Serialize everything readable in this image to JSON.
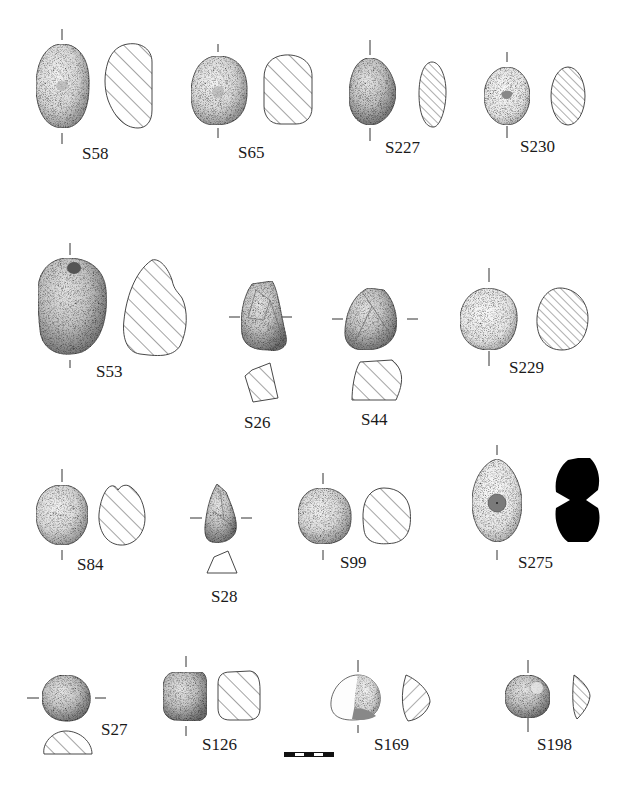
{
  "plate": {
    "type": "archaeological artifact illustration plate",
    "background": "#ffffff",
    "line_color": "#222222",
    "section_fill_black": "#000000"
  },
  "artifacts": [
    {
      "id": "S58",
      "label": "S58",
      "row": 1,
      "section": "hatched"
    },
    {
      "id": "S65",
      "label": "S65",
      "row": 1,
      "section": "hatched"
    },
    {
      "id": "S227",
      "label": "S227",
      "row": 1,
      "section": "hatched"
    },
    {
      "id": "S230",
      "label": "S230",
      "row": 1,
      "section": "hatched"
    },
    {
      "id": "S53",
      "label": "S53",
      "row": 2,
      "section": "hatched"
    },
    {
      "id": "S26",
      "label": "S26",
      "row": 2,
      "section": "hatched-below"
    },
    {
      "id": "S44",
      "label": "S44",
      "row": 2,
      "section": "hatched-below"
    },
    {
      "id": "S229",
      "label": "S229",
      "row": 2,
      "section": "hatched"
    },
    {
      "id": "S84",
      "label": "S84",
      "row": 3,
      "section": "hatched"
    },
    {
      "id": "S28",
      "label": "S28",
      "row": 3,
      "section": "outline-below"
    },
    {
      "id": "S99",
      "label": "S99",
      "row": 3,
      "section": "hatched"
    },
    {
      "id": "S275",
      "label": "S275",
      "row": 3,
      "section": "solid-black-perforated"
    },
    {
      "id": "S27",
      "label": "S27",
      "row": 4,
      "section": "hatched-below"
    },
    {
      "id": "S126",
      "label": "S126",
      "row": 4,
      "section": "hatched"
    },
    {
      "id": "S169",
      "label": "S169",
      "row": 4,
      "section": "hatched"
    },
    {
      "id": "S198",
      "label": "S198",
      "row": 4,
      "section": "hatched"
    }
  ],
  "scale_bar": {
    "segments": 5,
    "pattern": [
      "black",
      "white",
      "black",
      "white",
      "black"
    ]
  }
}
